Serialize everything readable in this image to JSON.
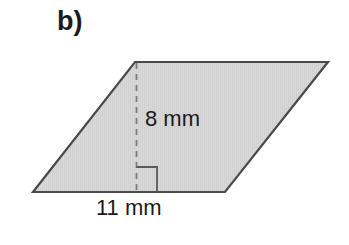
{
  "figure": {
    "part_label": "b)",
    "shape_name": "parallelogram",
    "height_label": "8 mm",
    "base_label": "11 mm",
    "height_value": 8,
    "base_value": 11,
    "unit": "mm",
    "fill_color": "#d6d6d6",
    "stroke_color": "#4a4a4a",
    "dash_color": "#6e6e6e",
    "text_color": "#1b1b1b",
    "background_color": "#ffffff",
    "right_angle_marker": "right-angle",
    "vertices": {
      "bottom_left": "33,192",
      "top_left": "135,62",
      "top_right": "328,62",
      "bottom_right": "225,192"
    },
    "height_line": {
      "x": 136,
      "y_top": 62,
      "y_bottom": 192
    },
    "right_angle_square": {
      "x_left": 136,
      "x_right": 157,
      "y_top": 167,
      "y_bottom": 192
    }
  }
}
